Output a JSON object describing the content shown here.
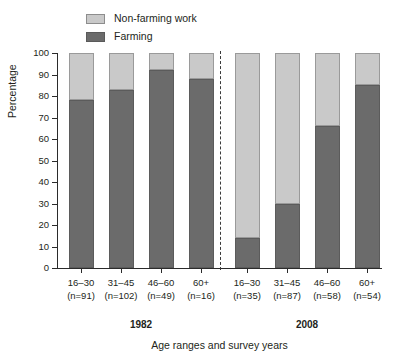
{
  "chart_data": {
    "type": "bar",
    "subtype": "stacked-percentage",
    "title": "",
    "xlabel": "Age ranges and survey years",
    "ylabel": "Percentage",
    "ylim": [
      0,
      100
    ],
    "yticks": [
      0,
      10,
      20,
      30,
      40,
      50,
      60,
      70,
      80,
      90,
      100
    ],
    "ytick_labels": [
      "0",
      "10",
      "20",
      "30",
      "40",
      "50",
      "60",
      "70",
      "80",
      "90",
      "100"
    ],
    "grid": false,
    "legend_position": "top-left",
    "categories": [
      "16–30",
      "31–45",
      "46–60",
      "60+",
      "16–30",
      "31–45",
      "46–60",
      "60+"
    ],
    "category_counts": [
      "(n=91)",
      "(n=102)",
      "(n=49)",
      "(n=16)",
      "(n=35)",
      "(n=87)",
      "(n=58)",
      "(n=54)"
    ],
    "series": [
      {
        "name": "Farming",
        "color": "#6b6b6b",
        "values": [
          78,
          83,
          92,
          88,
          14,
          30,
          66,
          85
        ]
      },
      {
        "name": "Non-farming work",
        "color": "#c9c9c9",
        "values": [
          22,
          17,
          8,
          12,
          86,
          70,
          34,
          15
        ]
      }
    ],
    "groups": [
      {
        "label": "1982",
        "categories": [
          0,
          1,
          2,
          3
        ]
      },
      {
        "label": "2008",
        "categories": [
          4,
          5,
          6,
          7
        ]
      }
    ],
    "annotations": {
      "divider": "dashed vertical line separating 1982 and 2008 survey years"
    }
  },
  "legend": {
    "items": [
      {
        "label": "Non-farming work",
        "color": "#c9c9c9"
      },
      {
        "label": "Farming",
        "color": "#6b6b6b"
      }
    ]
  },
  "axes": {
    "y_title": "Percentage",
    "x_title": "Age ranges and survey years"
  },
  "bars": [
    {
      "range": "16–30",
      "count": "(n=91)",
      "farming": 78,
      "nonfarming": 22,
      "group": "1982"
    },
    {
      "range": "31–45",
      "count": "(n=102)",
      "farming": 83,
      "nonfarming": 17,
      "group": "1982"
    },
    {
      "range": "46–60",
      "count": "(n=49)",
      "farming": 92,
      "nonfarming": 8,
      "group": "1982"
    },
    {
      "range": "60+",
      "count": "(n=16)",
      "farming": 88,
      "nonfarming": 12,
      "group": "1982"
    },
    {
      "range": "16–30",
      "count": "(n=35)",
      "farming": 14,
      "nonfarming": 86,
      "group": "2008"
    },
    {
      "range": "31–45",
      "count": "(n=87)",
      "farming": 30,
      "nonfarming": 70,
      "group": "2008"
    },
    {
      "range": "46–60",
      "count": "(n=58)",
      "farming": 66,
      "nonfarming": 34,
      "group": "2008"
    },
    {
      "range": "60+",
      "count": "(n=54)",
      "farming": 85,
      "nonfarming": 15,
      "group": "2008"
    }
  ],
  "groups": [
    {
      "label": "1982"
    },
    {
      "label": "2008"
    }
  ],
  "yticks": [
    {
      "label": "100"
    },
    {
      "label": "90"
    },
    {
      "label": "80"
    },
    {
      "label": "70"
    },
    {
      "label": "60"
    },
    {
      "label": "50"
    },
    {
      "label": "40"
    },
    {
      "label": "30"
    },
    {
      "label": "20"
    },
    {
      "label": "10"
    },
    {
      "label": "0"
    }
  ]
}
